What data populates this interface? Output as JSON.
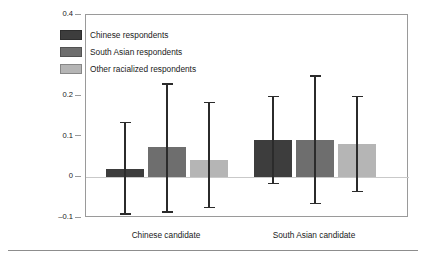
{
  "chart_data": {
    "type": "bar",
    "title": "",
    "subtitle": "",
    "xlabel": "",
    "ylabel": "",
    "categories": [
      "Chinese candidate",
      "South Asian candidate"
    ],
    "ylim": [
      -0.1,
      0.4
    ],
    "yticks": [
      0.4,
      0.3,
      0.2,
      0.1,
      0,
      -0.1
    ],
    "ytick_labels": [
      "0.4",
      "0.3",
      "0.2",
      "0.1",
      "0",
      "–0.1"
    ],
    "grid": false,
    "zero_line": true,
    "legend_position": "upper-left-inside",
    "error_bars": "confidence interval",
    "series": [
      {
        "name": "Chinese respondents",
        "color": "#3d3d3d",
        "values": [
          0.02,
          0.092
        ],
        "ci_low": [
          -0.09,
          -0.015
        ],
        "ci_high": [
          0.135,
          0.2
        ]
      },
      {
        "name": "South Asian respondents",
        "color": "#6e6e6e",
        "values": [
          0.075,
          0.092
        ],
        "ci_low": [
          -0.085,
          -0.065
        ],
        "ci_high": [
          0.23,
          0.25
        ]
      },
      {
        "name": "Other racialized respondents",
        "color": "#b5b5b5",
        "values": [
          0.043,
          0.083
        ],
        "ci_low": [
          -0.075,
          -0.035
        ],
        "ci_high": [
          0.185,
          0.2
        ]
      }
    ]
  },
  "legend": {
    "items": [
      {
        "label": "Chinese respondents",
        "color": "#3d3d3d"
      },
      {
        "label": "South Asian respondents",
        "color": "#6e6e6e"
      },
      {
        "label": "Other racialized respondents",
        "color": "#b5b5b5"
      }
    ]
  },
  "axis": {
    "y_tick_labels": [
      "0.4",
      "0.3",
      "0.2",
      "0.1",
      "0",
      "–0.1"
    ],
    "x_category_labels": [
      "Chinese candidate",
      "South Asian candidate"
    ]
  },
  "colors": {
    "frame": "#9a9a9a",
    "zero_line": "#c9c9c9",
    "error_bar": "#2b2b2b",
    "bottom_rule": "#8d8d8d",
    "text": "#1a1a1a"
  }
}
